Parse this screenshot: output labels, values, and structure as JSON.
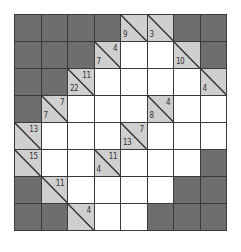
{
  "puzzle": {
    "type": "kakuro",
    "rows": 8,
    "cols": 8,
    "colors": {
      "block": "#6e6e6e",
      "clue": "#cfcfcf",
      "empty": "#ffffff",
      "grid_line": "#3a3a3a"
    },
    "grid": [
      [
        {
          "t": "D"
        },
        {
          "t": "D"
        },
        {
          "t": "D"
        },
        {
          "t": "D"
        },
        {
          "t": "C",
          "down": "9"
        },
        {
          "t": "C",
          "down": "3"
        },
        {
          "t": "D"
        },
        {
          "t": "D"
        }
      ],
      [
        {
          "t": "D"
        },
        {
          "t": "D"
        },
        {
          "t": "D"
        },
        {
          "t": "C",
          "down": "7",
          "across": "4"
        },
        {
          "t": "W"
        },
        {
          "t": "W"
        },
        {
          "t": "C",
          "down": "10"
        },
        {
          "t": "D"
        }
      ],
      [
        {
          "t": "D"
        },
        {
          "t": "D"
        },
        {
          "t": "C",
          "down": "22",
          "across": "11"
        },
        {
          "t": "W"
        },
        {
          "t": "W"
        },
        {
          "t": "W"
        },
        {
          "t": "W"
        },
        {
          "t": "C",
          "down": "4"
        }
      ],
      [
        {
          "t": "D"
        },
        {
          "t": "C",
          "down": "7",
          "across": "7"
        },
        {
          "t": "W"
        },
        {
          "t": "W"
        },
        {
          "t": "W"
        },
        {
          "t": "C",
          "down": "8",
          "across": "4"
        },
        {
          "t": "W"
        },
        {
          "t": "W"
        }
      ],
      [
        {
          "t": "C",
          "across": "13"
        },
        {
          "t": "W"
        },
        {
          "t": "W"
        },
        {
          "t": "W"
        },
        {
          "t": "C",
          "down": "13",
          "across": "7"
        },
        {
          "t": "W"
        },
        {
          "t": "W"
        },
        {
          "t": "W"
        }
      ],
      [
        {
          "t": "C",
          "across": "15"
        },
        {
          "t": "W"
        },
        {
          "t": "W"
        },
        {
          "t": "C",
          "down": "4",
          "across": "11"
        },
        {
          "t": "W"
        },
        {
          "t": "W"
        },
        {
          "t": "W"
        },
        {
          "t": "D"
        }
      ],
      [
        {
          "t": "D"
        },
        {
          "t": "C",
          "across": "11"
        },
        {
          "t": "W"
        },
        {
          "t": "W"
        },
        {
          "t": "W"
        },
        {
          "t": "W"
        },
        {
          "t": "D"
        },
        {
          "t": "D"
        }
      ],
      [
        {
          "t": "D"
        },
        {
          "t": "D"
        },
        {
          "t": "C",
          "across": "4"
        },
        {
          "t": "W"
        },
        {
          "t": "W"
        },
        {
          "t": "D"
        },
        {
          "t": "D"
        },
        {
          "t": "D"
        }
      ]
    ]
  }
}
